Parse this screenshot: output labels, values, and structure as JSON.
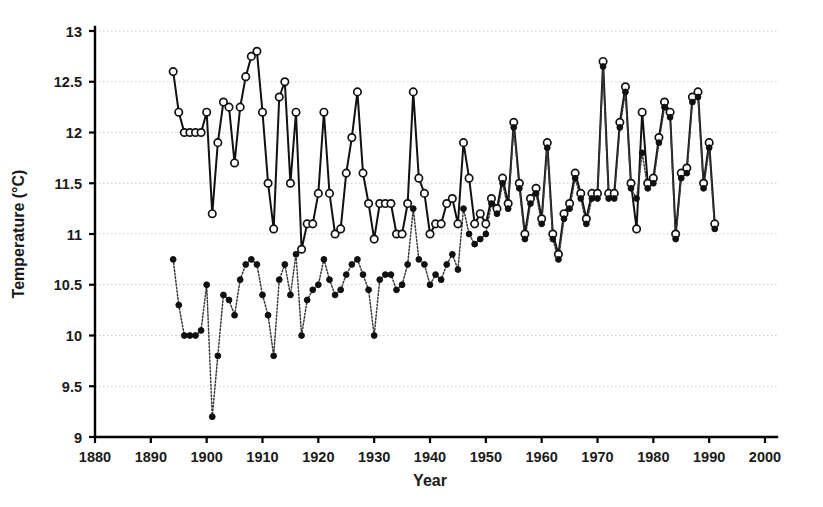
{
  "chart_data": {
    "type": "line",
    "title": "",
    "subtitle": "",
    "xlabel": "Year",
    "ylabel": "Temperature (°C)",
    "xlim": [
      1880,
      2000
    ],
    "ylim": [
      9,
      13
    ],
    "xticks": [
      1880,
      1890,
      1900,
      1910,
      1920,
      1930,
      1940,
      1950,
      1960,
      1970,
      1980,
      1990,
      2000
    ],
    "yticks": [
      9,
      9.5,
      10,
      10.5,
      11,
      11.5,
      12,
      12.5,
      13
    ],
    "xtick_labels": [
      "1880",
      "1890",
      "1900",
      "1910",
      "1920",
      "1930",
      "1940",
      "1950",
      "1960",
      "1970",
      "1980",
      "1990",
      "2000"
    ],
    "ytick_labels": [
      "9",
      "9.5",
      "10",
      "10.5",
      "11",
      "11.5",
      "12",
      "12.5",
      "13"
    ],
    "grid": true,
    "grid_axis": "y",
    "legend": null,
    "legend_position": "none",
    "annotations": [],
    "series": [
      {
        "name": "upper-series-open-circles",
        "marker": "open-circle",
        "linestyle": "solid",
        "color": "#111111",
        "x": [
          1894,
          1895,
          1896,
          1897,
          1898,
          1899,
          1900,
          1901,
          1902,
          1903,
          1904,
          1905,
          1906,
          1907,
          1908,
          1909,
          1910,
          1911,
          1912,
          1913,
          1914,
          1915,
          1916,
          1917,
          1918,
          1919,
          1920,
          1921,
          1922,
          1923,
          1924,
          1925,
          1926,
          1927,
          1928,
          1929,
          1930,
          1931,
          1932,
          1933,
          1934,
          1935,
          1936,
          1937,
          1938,
          1939,
          1940,
          1941,
          1942,
          1943,
          1944,
          1945,
          1946,
          1947,
          1948,
          1949,
          1950,
          1951,
          1952,
          1953,
          1954,
          1955,
          1956,
          1957,
          1958,
          1959,
          1960,
          1961,
          1962,
          1963,
          1964,
          1965,
          1966,
          1967,
          1968,
          1969,
          1970,
          1971,
          1972,
          1973,
          1974,
          1975,
          1976,
          1977,
          1978,
          1979,
          1980,
          1981,
          1982,
          1983,
          1984,
          1985,
          1986,
          1987,
          1988,
          1989,
          1990,
          1991
        ],
        "y": [
          12.6,
          12.2,
          12.0,
          12.0,
          12.0,
          12.0,
          12.2,
          11.2,
          11.9,
          12.3,
          12.25,
          11.7,
          12.25,
          12.55,
          12.75,
          12.8,
          12.2,
          11.5,
          11.05,
          12.35,
          12.5,
          11.5,
          12.2,
          10.85,
          11.1,
          11.1,
          11.4,
          12.2,
          11.4,
          11.0,
          11.05,
          11.6,
          11.95,
          12.4,
          11.6,
          11.3,
          10.95,
          11.3,
          11.3,
          11.3,
          11.0,
          11.0,
          11.3,
          12.4,
          11.55,
          11.4,
          11.0,
          11.1,
          11.1,
          11.3,
          11.35,
          11.1,
          11.9,
          11.55,
          11.1,
          11.2,
          11.1,
          11.35,
          11.25,
          11.55,
          11.3,
          12.1,
          11.5,
          11.0,
          11.35,
          11.45,
          11.15,
          11.9,
          11.0,
          10.8,
          11.2,
          11.3,
          11.6,
          11.4,
          11.15,
          11.4,
          11.4,
          12.7,
          11.4,
          11.4,
          12.1,
          12.45,
          11.5,
          11.05,
          12.2,
          11.5,
          11.55,
          11.95,
          12.3,
          12.2,
          11.0,
          11.6,
          11.65,
          12.35,
          12.4,
          11.5,
          11.9,
          11.1
        ]
      },
      {
        "name": "lower-series-filled-circles",
        "marker": "filled-circle",
        "linestyle": "dotted",
        "color": "#101010",
        "x": [
          1894,
          1895,
          1896,
          1897,
          1898,
          1899,
          1900,
          1901,
          1902,
          1903,
          1904,
          1905,
          1906,
          1907,
          1908,
          1909,
          1910,
          1911,
          1912,
          1913,
          1914,
          1915,
          1916,
          1917,
          1918,
          1919,
          1920,
          1921,
          1922,
          1923,
          1924,
          1925,
          1926,
          1927,
          1928,
          1929,
          1930,
          1931,
          1932,
          1933,
          1934,
          1935,
          1936,
          1937,
          1938,
          1939,
          1940,
          1941,
          1942,
          1943,
          1944,
          1945,
          1946,
          1947,
          1948,
          1949,
          1950,
          1951,
          1952,
          1953,
          1954,
          1955,
          1956,
          1957,
          1958,
          1959,
          1960,
          1961,
          1962,
          1963,
          1964,
          1965,
          1966,
          1967,
          1968,
          1969,
          1970,
          1971,
          1972,
          1973,
          1974,
          1975,
          1976,
          1977,
          1978,
          1979,
          1980,
          1981,
          1982,
          1983,
          1984,
          1985,
          1986,
          1987,
          1988,
          1989,
          1990,
          1991
        ],
        "y": [
          10.75,
          10.3,
          10.0,
          10.0,
          10.0,
          10.05,
          10.5,
          9.2,
          9.8,
          10.4,
          10.35,
          10.2,
          10.55,
          10.7,
          10.75,
          10.7,
          10.4,
          10.2,
          9.8,
          10.55,
          10.7,
          10.4,
          10.8,
          10.0,
          10.35,
          10.45,
          10.5,
          10.75,
          10.55,
          10.4,
          10.45,
          10.6,
          10.7,
          10.75,
          10.6,
          10.45,
          10.0,
          10.55,
          10.6,
          10.6,
          10.45,
          10.5,
          10.7,
          11.25,
          10.75,
          10.7,
          10.5,
          10.6,
          10.55,
          10.7,
          10.8,
          10.65,
          11.25,
          11.0,
          10.9,
          10.95,
          11.0,
          11.3,
          11.2,
          11.5,
          11.25,
          12.05,
          11.45,
          10.95,
          11.3,
          11.4,
          11.1,
          11.85,
          10.95,
          10.75,
          11.15,
          11.25,
          11.55,
          11.35,
          11.1,
          11.35,
          11.35,
          12.65,
          11.35,
          11.35,
          12.05,
          12.4,
          11.45,
          11.35,
          11.8,
          11.45,
          11.5,
          11.9,
          12.25,
          12.15,
          10.95,
          11.55,
          11.6,
          12.3,
          12.35,
          11.45,
          11.85,
          11.05
        ]
      }
    ]
  },
  "plot_geometry": {
    "left": 95,
    "right": 765,
    "top": 31,
    "bottom": 437
  }
}
